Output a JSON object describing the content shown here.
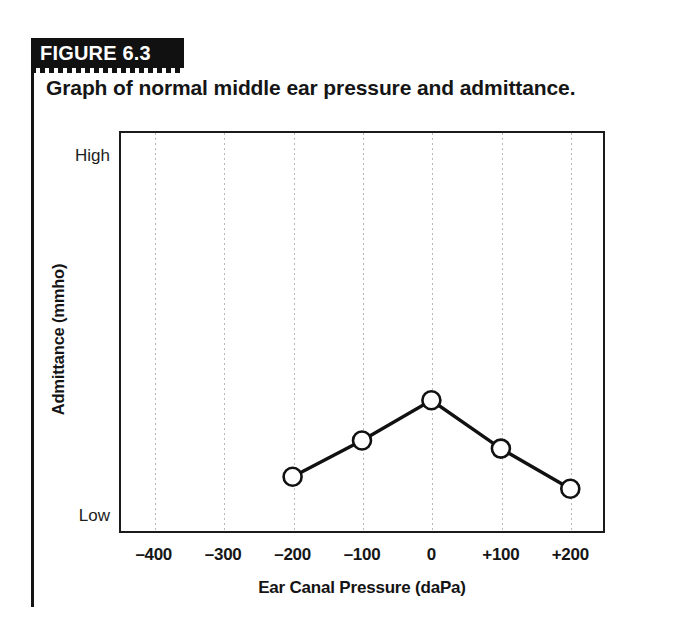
{
  "figure": {
    "banner_label": "FIGURE 6.3",
    "caption": "Graph of normal middle ear pressure and admittance."
  },
  "chart_data": {
    "type": "line",
    "title": "Graph of normal middle ear pressure and admittance.",
    "xlabel": "Ear Canal Pressure (daPa)",
    "ylabel": "Admittance (mmho)",
    "x_tick_labels": [
      "–400",
      "–300",
      "–200",
      "–100",
      "0",
      "+100",
      "+200"
    ],
    "x_tick_values": [
      -400,
      -300,
      -200,
      -100,
      0,
      100,
      200
    ],
    "y_tick_labels": [
      "High",
      "Low"
    ],
    "y_tick_positions": [
      1.0,
      0.0
    ],
    "xlim": [
      -450,
      250
    ],
    "ylim": [
      0,
      1
    ],
    "grid": "vertical-dotted",
    "legend": "none",
    "marker": "open-circle",
    "line_color": "#111111",
    "marker_fill": "#ffffff",
    "grid_color": "#b9b9b9",
    "series": [
      {
        "name": "Tympanogram",
        "x": [
          -200,
          -100,
          0,
          100,
          200
        ],
        "y": [
          0.14,
          0.23,
          0.33,
          0.21,
          0.11
        ],
        "point_labels": [
          "–200",
          "–100",
          "0",
          "+100",
          "+200"
        ]
      }
    ]
  }
}
